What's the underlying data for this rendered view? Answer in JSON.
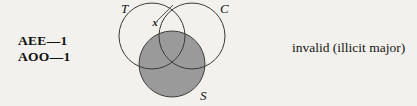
{
  "background_color": "#f3f1ed",
  "premises": {
    "line1": "AEE—1",
    "line2": "AOO—1"
  },
  "verdict": {
    "text": "invalid (illicit major)"
  },
  "diagram": {
    "type": "three-circle-venn",
    "circles": [
      {
        "label": "T",
        "cx": 42,
        "cy": 36,
        "r": 33,
        "label_x": 11,
        "label_y": 13
      },
      {
        "label": "C",
        "cx": 82,
        "cy": 36,
        "r": 33,
        "label_x": 110,
        "label_y": 13
      },
      {
        "label": "S",
        "cx": 62,
        "cy": 64,
        "r": 33,
        "label_x": 90,
        "label_y": 100
      }
    ],
    "shading": {
      "region": "S",
      "color": "#9a9a9a",
      "description": "entire S circle shaded"
    },
    "marks": [
      {
        "symbol": "x",
        "x": 45,
        "y": 26,
        "pointer_from_x": 47,
        "pointer_from_y": 21,
        "pointer_to_x": 63,
        "pointer_to_y": 5
      }
    ],
    "stroke_color": "#3a3a3a"
  }
}
